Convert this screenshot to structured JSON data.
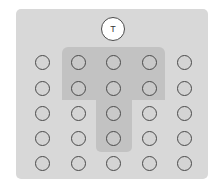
{
  "diagram": {
    "teacher": {
      "label": "T"
    },
    "grid": {
      "rows": 5,
      "cols": 5
    },
    "highlight_shape": "T",
    "highlighted_seats": [
      [
        0,
        1
      ],
      [
        0,
        2
      ],
      [
        0,
        3
      ],
      [
        1,
        1
      ],
      [
        1,
        2
      ],
      [
        1,
        3
      ],
      [
        2,
        2
      ],
      [
        3,
        2
      ]
    ],
    "colors": {
      "background": "#ffffff",
      "panel": "#d8d8d8",
      "highlight": "#c2c2c2",
      "seat_fill": "#d4d4d4",
      "seat_border": "#4a4a4a",
      "teacher_fill": "#ffffff"
    }
  }
}
